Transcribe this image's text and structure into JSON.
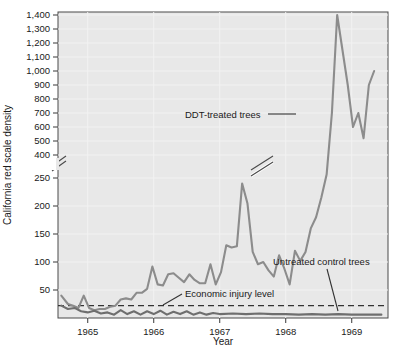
{
  "chart_data": {
    "type": "line",
    "title": "",
    "xlabel": "Year",
    "ylabel": "California red scale density",
    "grid": true,
    "legend": "annotations",
    "axis_break": {
      "y_break_low": 250,
      "y_break_high": 400,
      "note": "y-axis broken between 250 and 400"
    },
    "y_ticks_lower": [
      50,
      100,
      150,
      200,
      250
    ],
    "y_ticks_upper": [
      400,
      500,
      600,
      700,
      800,
      900,
      1000,
      1100,
      1200,
      1300,
      1400
    ],
    "y_tick_labels": [
      "50",
      "100",
      "150",
      "200",
      "250",
      "400",
      "500",
      "600",
      "700",
      "800",
      "900",
      "1,000",
      "1,100",
      "1,200",
      "1,300",
      "1,400"
    ],
    "ylim_lower": [
      0,
      250
    ],
    "ylim_upper": [
      400,
      1400
    ],
    "x_ticks": [
      1965,
      1966,
      1967,
      1968,
      1969
    ],
    "x_tick_labels": [
      "1965",
      "1966",
      "1967",
      "1968",
      "1969"
    ],
    "xlim": [
      1964.55,
      1969.55
    ],
    "annotations": [
      {
        "text": "DDT-treated trees",
        "x": 1966.0,
        "y": 690
      },
      {
        "text": "Untreated control trees",
        "x": 1968.1,
        "y": 60
      },
      {
        "text": "Economic injury level",
        "x": 1966.1,
        "y": 28
      }
    ],
    "series": [
      {
        "name": "DDT-treated trees",
        "color": "#8c8c8c",
        "x": [
          1964.6,
          1964.7,
          1964.78,
          1964.86,
          1964.94,
          1965.02,
          1965.1,
          1965.18,
          1965.26,
          1965.34,
          1965.42,
          1965.5,
          1965.58,
          1965.66,
          1965.74,
          1965.82,
          1965.9,
          1965.98,
          1966.06,
          1966.14,
          1966.22,
          1966.3,
          1966.38,
          1966.46,
          1966.54,
          1966.62,
          1966.7,
          1966.78,
          1966.86,
          1966.94,
          1967.02,
          1967.1,
          1967.18,
          1967.26,
          1967.34,
          1967.42,
          1967.5,
          1967.58,
          1967.66,
          1967.74,
          1967.82,
          1967.9,
          1967.98,
          1968.06,
          1968.14,
          1968.22,
          1968.3,
          1968.38,
          1968.46,
          1968.54,
          1968.62,
          1968.7,
          1968.78,
          1968.86,
          1968.94,
          1969.02,
          1969.1,
          1969.18,
          1969.26,
          1969.34
        ],
        "y": [
          40,
          25,
          22,
          18,
          40,
          18,
          14,
          16,
          16,
          20,
          22,
          33,
          35,
          33,
          45,
          45,
          52,
          92,
          60,
          58,
          78,
          80,
          72,
          64,
          78,
          68,
          62,
          62,
          96,
          60,
          82,
          130,
          126,
          128,
          240,
          205,
          118,
          96,
          100,
          85,
          74,
          112,
          88,
          60,
          120,
          102,
          118,
          160,
          180,
          215,
          260,
          700,
          1400,
          1150,
          900,
          600,
          700,
          520,
          900,
          1000
        ]
      },
      {
        "name": "Untreated control trees",
        "color": "#6e6e6e",
        "x": [
          1964.6,
          1964.7,
          1964.8,
          1964.9,
          1965.0,
          1965.1,
          1965.2,
          1965.3,
          1965.4,
          1965.5,
          1965.6,
          1965.7,
          1965.8,
          1965.9,
          1966.0,
          1966.1,
          1966.2,
          1966.3,
          1966.4,
          1966.5,
          1966.6,
          1966.7,
          1966.8,
          1966.9,
          1967.0,
          1967.2,
          1967.4,
          1967.6,
          1967.8,
          1968.0,
          1968.2,
          1968.4,
          1968.6,
          1968.8,
          1969.0,
          1969.2,
          1969.4,
          1969.45
        ],
        "y": [
          22,
          16,
          18,
          12,
          10,
          13,
          8,
          10,
          6,
          14,
          7,
          12,
          6,
          12,
          7,
          13,
          6,
          11,
          7,
          12,
          6,
          10,
          6,
          9,
          7,
          8,
          7,
          8,
          7,
          7,
          6,
          7,
          6,
          7,
          6,
          6,
          6,
          6
        ]
      }
    ],
    "threshold_line": {
      "name": "Economic injury level",
      "value": 22,
      "style": "dashed",
      "color": "#333333"
    }
  },
  "axis": {
    "y_title": "California red scale density",
    "x_title": "Year"
  }
}
